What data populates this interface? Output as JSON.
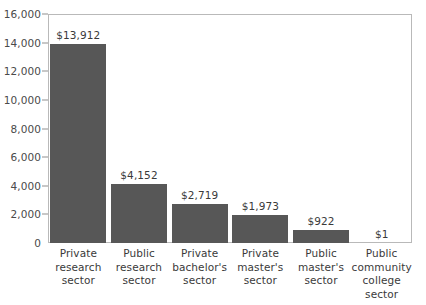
{
  "chart_data": {
    "type": "bar",
    "title": "",
    "subtitle": "",
    "xlabel": "",
    "ylabel": "",
    "categories": [
      "Private research sector",
      "Public research sector",
      "Private bachelor's sector",
      "Private master's sector",
      "Public master's sector",
      "Public community college sector"
    ],
    "category_lines": [
      [
        "Private",
        "research",
        "sector"
      ],
      [
        "Public",
        "research",
        "sector"
      ],
      [
        "Private",
        "bachelor's",
        "sector"
      ],
      [
        "Private",
        "master's",
        "sector"
      ],
      [
        "Public",
        "master's",
        "sector"
      ],
      [
        "Public",
        "community",
        "college",
        "sector"
      ]
    ],
    "values": [
      13912,
      4152,
      2719,
      1973,
      922,
      1
    ],
    "value_labels": [
      "$13,912",
      "$4,152",
      "$2,719",
      "$1,973",
      "$922",
      "$1"
    ],
    "ylim": [
      0,
      16000
    ],
    "ytick_values": [
      0,
      2000,
      4000,
      6000,
      8000,
      10000,
      12000,
      14000,
      16000
    ],
    "ytick_labels": [
      "0",
      "2,000",
      "4,000",
      "6,000",
      "8,000",
      "10,000",
      "12,000",
      "14,000",
      "16,000"
    ],
    "grid": false,
    "legend": "none",
    "bar_color": "#575757",
    "axis_color": "#b9b9b9",
    "text_color": "#3a3a3a"
  }
}
